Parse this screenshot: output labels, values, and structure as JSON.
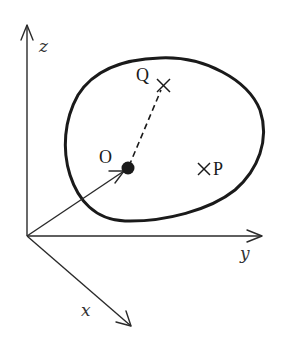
{
  "diagram": {
    "axes": {
      "z": {
        "label": "z"
      },
      "y": {
        "label": "y"
      },
      "x": {
        "label": "x"
      }
    },
    "points": {
      "O": {
        "label": "O",
        "marker": "filled-dot"
      },
      "Q": {
        "label": "Q",
        "marker": "cross"
      },
      "P": {
        "label": "P",
        "marker": "cross"
      }
    },
    "connectors": [
      {
        "from": "axes-origin",
        "to": "O",
        "style": "solid-arrow"
      },
      {
        "from": "O",
        "to": "Q",
        "style": "dashed"
      }
    ],
    "region": {
      "shape": "closed-blob",
      "contains": [
        "O",
        "Q",
        "P"
      ]
    },
    "colors": {
      "ink": "#1a1a1a",
      "axis": "#2a2a2a",
      "label": "#333333",
      "background": "#ffffff"
    }
  }
}
